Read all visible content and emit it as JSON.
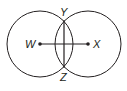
{
  "diagram": {
    "type": "geometry-construction",
    "stroke_color": "#231f20",
    "background": "#ffffff",
    "circles": [
      {
        "center_label": "W",
        "cx": 40,
        "cy": 44,
        "r": 33
      },
      {
        "center_label": "X",
        "cx": 88,
        "cy": 44,
        "r": 33
      }
    ],
    "points": {
      "W": {
        "label": "W"
      },
      "X": {
        "label": "X"
      },
      "Y": {
        "label": "Y"
      },
      "Z": {
        "label": "Z"
      }
    },
    "segments": [
      {
        "from": "W",
        "to": "X"
      },
      {
        "from": "Y",
        "to": "Z"
      }
    ]
  }
}
